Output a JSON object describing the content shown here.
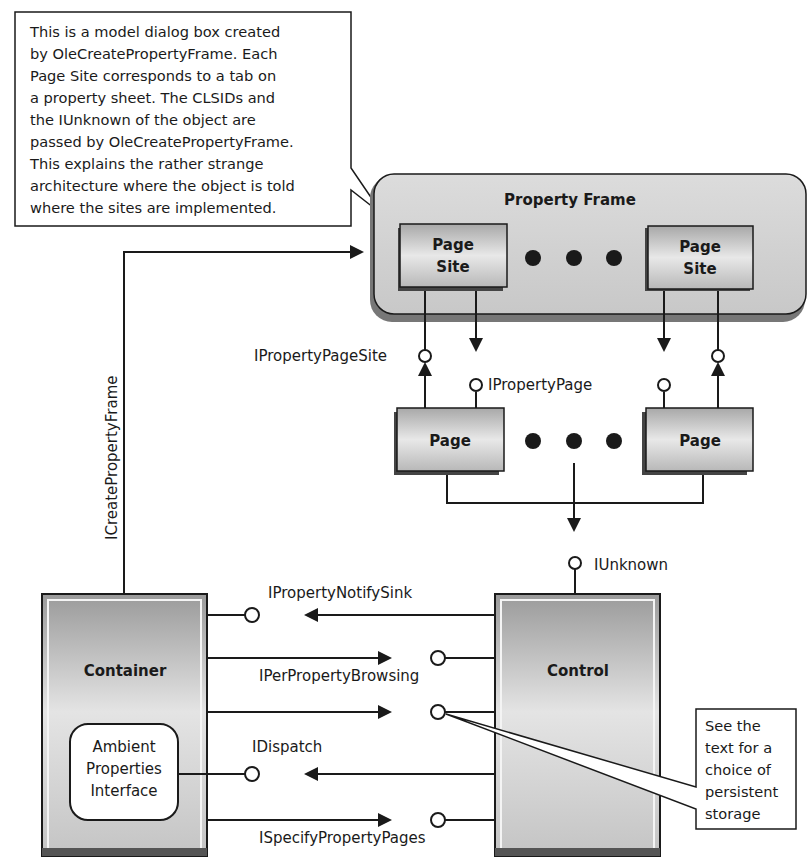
{
  "callout_top": {
    "lines": [
      "This is a model dialog box created",
      "by OleCreatePropertyFrame. Each",
      "Page Site corresponds to a tab on",
      "a property sheet. The CLSIDs and",
      "the IUnknown of the object are",
      "passed by OleCreatePropertyFrame.",
      "This explains the rather strange",
      "architecture where the object is told",
      "where the sites are implemented."
    ]
  },
  "property_frame": {
    "title": "Property Frame",
    "page_sites": [
      {
        "line1": "Page",
        "line2": "Site"
      },
      {
        "line1": "Page",
        "line2": "Site"
      }
    ]
  },
  "pages": [
    {
      "label": "Page"
    },
    {
      "label": "Page"
    }
  ],
  "interfaces": {
    "create_frame": "ICreatePropertyFrame",
    "page_site": "IPropertyPageSite",
    "page": "IPropertyPage",
    "unknown": "IUnknown",
    "notify_sink": "IPropertyNotifySink",
    "per_property_browsing": "IPerPropertyBrowsing",
    "dispatch": "IDispatch",
    "specify_pages": "ISpecifyPropertyPages"
  },
  "container": {
    "title": "Container",
    "ambient": {
      "line1": "Ambient",
      "line2": "Properties",
      "line3": "Interface"
    }
  },
  "control": {
    "title": "Control"
  },
  "callout_bottom": {
    "lines": [
      "See the",
      "text for a",
      "choice of",
      "persistent",
      "storage"
    ]
  },
  "colors": {
    "box_fill_dark": "#8c8c8c",
    "box_fill_light": "#e6e6e6",
    "frame_fill": "#d4d4d4",
    "stroke": "#1a1a1a"
  }
}
